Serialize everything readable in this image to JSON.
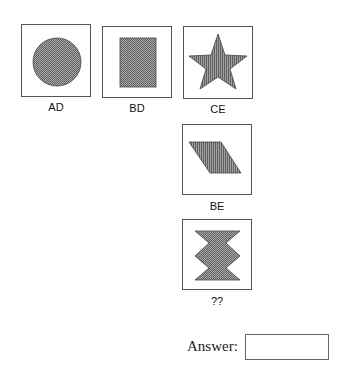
{
  "puzzle": {
    "items": [
      {
        "label": "AD",
        "shape": "circle",
        "fill": "dotted"
      },
      {
        "label": "BD",
        "shape": "rectangle",
        "fill": "dotted"
      },
      {
        "label": "CE",
        "shape": "star",
        "fill": "striped"
      },
      {
        "label": "BE",
        "shape": "parallelogram",
        "fill": "striped"
      },
      {
        "label": "??",
        "shape": "zigzag-hourglass",
        "fill": "dotted"
      }
    ]
  },
  "answer": {
    "label": "Answer:",
    "value": ""
  },
  "colors": {
    "fill": "#8a8a8a",
    "border": "#555555"
  }
}
